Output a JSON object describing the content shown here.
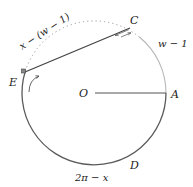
{
  "diagram": {
    "type": "circle-arc-diagram",
    "center": {
      "label": "O",
      "x": 94,
      "y": 93
    },
    "radius": 72,
    "points": [
      {
        "id": "A",
        "label": "A",
        "angle_deg": 0
      },
      {
        "id": "C",
        "label": "C",
        "angle_deg": 51
      },
      {
        "id": "E",
        "label": "E",
        "angle_deg": 163
      },
      {
        "id": "D",
        "label": "D",
        "angle_deg": -55
      }
    ],
    "arc_labels": {
      "arc_AC": "w − 1",
      "arc_CE_dotted": "x − (w − 1)",
      "arc_E_to_A_lower": "2π − x"
    },
    "colors": {
      "solid_arc": "#555555",
      "light_arc": "#b5b5b5",
      "dotted_arc": "#9a9a9a",
      "chord": "#444444",
      "radius_line": "#555555"
    }
  }
}
